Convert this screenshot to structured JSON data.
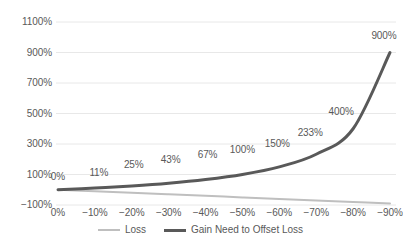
{
  "chart_data": {
    "type": "line",
    "title": "",
    "subtitle": "",
    "xlabel": "",
    "ylabel": "",
    "grid": true,
    "legend_position": "bottom",
    "x": [
      0,
      -10,
      -20,
      -30,
      -40,
      -50,
      -60,
      -70,
      -80,
      -90
    ],
    "categories": [
      "0%",
      "-10%",
      "-20%",
      "-30%",
      "-40%",
      "-50%",
      "-60%",
      "-70%",
      "-80%",
      "-90%"
    ],
    "xtick_labels": [
      "0%",
      "−10%",
      "−20%",
      "−30%",
      "−40%",
      "−50%",
      "−60%",
      "−70%",
      "−80%",
      "−90%"
    ],
    "ytick_labels": [
      "1100%",
      "900%",
      "700%",
      "500%",
      "300%",
      "100%",
      "−100%"
    ],
    "ytick_values": [
      1100,
      900,
      700,
      500,
      300,
      100,
      -100
    ],
    "ylim": [
      -100,
      1100
    ],
    "series": [
      {
        "name": "Loss",
        "color": "#bfbfbf",
        "width": 2,
        "values": [
          0,
          -10,
          -20,
          -30,
          -40,
          -50,
          -60,
          -70,
          -80,
          -90
        ],
        "data_labels": []
      },
      {
        "name": "Gain Need to Offset Loss",
        "color": "#595959",
        "width": 3,
        "values": [
          0,
          11,
          25,
          43,
          67,
          100,
          150,
          233,
          400,
          900
        ],
        "data_labels": [
          "0%",
          "11%",
          "25%",
          "43%",
          "67%",
          "100%",
          "150%",
          "233%",
          "400%",
          "900%"
        ]
      }
    ]
  },
  "legend": {
    "items": [
      {
        "label": "Loss",
        "marker": "line-swatch-light"
      },
      {
        "label": "Gain Need to Offset Loss",
        "marker": "line-swatch-dark"
      }
    ]
  },
  "colors": {
    "background": "#ffffff",
    "text": "#595959",
    "gridline": "#e8e8e8",
    "loss_line": "#bfbfbf",
    "gain_line": "#595959"
  }
}
